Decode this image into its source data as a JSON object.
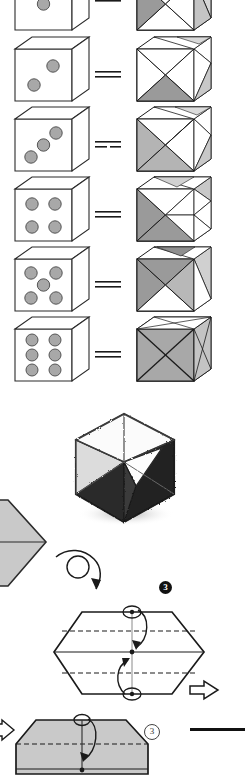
{
  "page": {
    "width": 245,
    "height": 773,
    "background": "#ffffff",
    "kind": "book-page-figure"
  },
  "palette": {
    "ink": "#1a1a1a",
    "outline": "#2b2b2b",
    "pip_fill": "#a8a8a8",
    "pip_stroke": "#555555",
    "face_white": "#ffffff",
    "face_light_gray": "#d6d6d6",
    "face_mid_gray": "#b4b4b4",
    "face_dark_gray": "#9a9a9a",
    "origami_gray": "#c9c9c9",
    "sketch_dark": "#2a2a2a",
    "sketch_shadow": "#bfbfbf"
  },
  "dice_rows": [
    {
      "index": 0,
      "label": "die-one",
      "pip_count": 1,
      "pips": [
        [
          0.5,
          0.5
        ]
      ],
      "equals_label": "=",
      "partial": true,
      "note": "top row cropped by page edge"
    },
    {
      "index": 1,
      "label": "die-two",
      "pip_count": 2,
      "pips": [
        [
          0.68,
          0.33
        ],
        [
          0.32,
          0.66
        ]
      ],
      "equals_label": "="
    },
    {
      "index": 2,
      "label": "die-three",
      "pip_count": 3,
      "pips": [
        [
          0.72,
          0.28
        ],
        [
          0.5,
          0.5
        ],
        [
          0.28,
          0.72
        ]
      ],
      "equals_label": "="
    },
    {
      "index": 3,
      "label": "die-four",
      "pip_count": 4,
      "pips": [
        [
          0.3,
          0.3
        ],
        [
          0.7,
          0.3
        ],
        [
          0.3,
          0.7
        ],
        [
          0.7,
          0.7
        ]
      ],
      "equals_label": "="
    },
    {
      "index": 4,
      "label": "die-five",
      "pip_count": 5,
      "pips": [
        [
          0.28,
          0.28
        ],
        [
          0.72,
          0.28
        ],
        [
          0.5,
          0.5
        ],
        [
          0.28,
          0.72
        ],
        [
          0.72,
          0.72
        ]
      ],
      "equals_label": "="
    },
    {
      "index": 5,
      "label": "die-six",
      "pip_count": 6,
      "pips": [
        [
          0.3,
          0.22
        ],
        [
          0.7,
          0.22
        ],
        [
          0.3,
          0.5
        ],
        [
          0.7,
          0.5
        ],
        [
          0.3,
          0.78
        ],
        [
          0.7,
          0.78
        ]
      ],
      "equals_label": "="
    }
  ],
  "sketch": {
    "name": "shaded-cube-sketch",
    "caption": ""
  },
  "origami": {
    "steps": [
      {
        "marker": "3",
        "marker_style": "filled",
        "name": "step-3-filled"
      },
      {
        "marker": "3",
        "marker_style": "outline",
        "name": "step-3-outline"
      }
    ],
    "hexagon": {
      "name": "hexagon-fold-diagram",
      "fold_lines": [
        "dashed-upper",
        "solid-center",
        "dashed-lower"
      ],
      "arrows": [
        "fold-down-arrow",
        "fold-up-arrow",
        "hollow-right-arrow"
      ]
    },
    "trapezoid": {
      "name": "trapezoid-fold-diagram",
      "fold_lines": [
        "dashed-center"
      ],
      "arrows": [
        "fold-down-arrow"
      ]
    },
    "rotate_arrow": {
      "name": "rotate-loop-arrow"
    },
    "rule": {
      "name": "horizontal-rule"
    }
  }
}
